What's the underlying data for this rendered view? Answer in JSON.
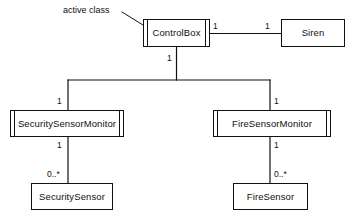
{
  "diagram": {
    "type": "uml-class-diagram",
    "title": "",
    "annotation": {
      "text": "active class",
      "points_to": "ControlBox"
    },
    "classes": [
      {
        "id": "control-box",
        "name": "ControlBox",
        "stereotype": "active",
        "x": 143,
        "y": 19,
        "w": 67,
        "h": 28
      },
      {
        "id": "siren",
        "name": "Siren",
        "stereotype": "passive",
        "x": 281,
        "y": 19,
        "w": 64,
        "h": 28
      },
      {
        "id": "security-sensor-monitor",
        "name": "SecuritySensorMonitor",
        "stereotype": "active",
        "x": 10,
        "y": 110,
        "w": 114,
        "h": 27
      },
      {
        "id": "fire-sensor-monitor",
        "name": "FireSensorMonitor",
        "stereotype": "active",
        "x": 213,
        "y": 110,
        "w": 118,
        "h": 27
      },
      {
        "id": "security-sensor",
        "name": "SecuritySensor",
        "stereotype": "passive",
        "x": 31,
        "y": 183,
        "w": 82,
        "h": 27
      },
      {
        "id": "fire-sensor",
        "name": "FireSensor",
        "stereotype": "passive",
        "x": 233,
        "y": 183,
        "w": 75,
        "h": 27
      }
    ],
    "associations": [
      {
        "id": "controlbox-siren",
        "from": "ControlBox",
        "to": "Siren",
        "from_multiplicity": "1",
        "to_multiplicity": "1"
      },
      {
        "id": "controlbox-monitors",
        "from": "ControlBox",
        "to": "SecuritySensorMonitor / FireSensorMonitor",
        "from_multiplicity": "1",
        "security_multiplicity": "1",
        "fire_multiplicity": "1"
      },
      {
        "id": "securitymonitor-securitysensor",
        "from": "SecuritySensorMonitor",
        "to": "SecuritySensor",
        "from_multiplicity": "1",
        "to_multiplicity": "0..*"
      },
      {
        "id": "firemonitor-firesensor",
        "from": "FireSensorMonitor",
        "to": "FireSensor",
        "from_multiplicity": "1",
        "to_multiplicity": "0..*"
      }
    ],
    "multiplicity_labels": {
      "controlbox_right": "1",
      "siren_left": "1",
      "controlbox_bottom": "1",
      "security_monitor_top": "1",
      "fire_monitor_top": "1",
      "security_monitor_bottom": "1",
      "fire_monitor_bottom": "1",
      "security_sensor_top": "0..*",
      "fire_sensor_top": "0..*"
    },
    "colors": {
      "line": "#111111",
      "box_fill": "#ffffff",
      "text": "#101010",
      "background": "#ffffff"
    }
  }
}
